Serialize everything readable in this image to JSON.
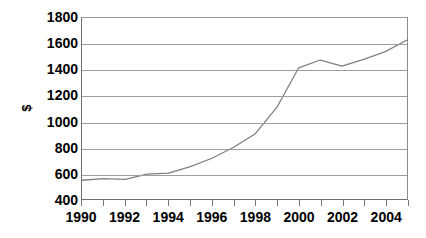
{
  "chart_data": {
    "type": "line",
    "title": "",
    "subtitle": "",
    "xlabel": "",
    "ylabel": "$",
    "xlim": [
      1990,
      2005
    ],
    "ylim": [
      400,
      1800
    ],
    "y_ticks": [
      1800,
      1600,
      1400,
      1200,
      1000,
      800,
      600,
      400
    ],
    "x_ticks": [
      1990,
      1991,
      1992,
      1993,
      1994,
      1995,
      1996,
      1997,
      1998,
      1999,
      2000,
      2001,
      2002,
      2003,
      2004,
      2005
    ],
    "x_tick_labels": [
      "1990",
      "1992",
      "1994",
      "1996",
      "1998",
      "2000",
      "2002",
      "2004"
    ],
    "x_tick_labels_years": [
      1990,
      1992,
      1994,
      1996,
      1998,
      2000,
      2002,
      2004
    ],
    "grid": true,
    "grid_axis": "y",
    "legend": false,
    "legend_position": "none",
    "series": [
      {
        "name": "$",
        "color": "#808080",
        "x": [
          1990,
          1991,
          1992,
          1993,
          1994,
          1995,
          1996,
          1997,
          1998,
          1999,
          2000,
          2001,
          2002,
          2003,
          2004,
          2005
        ],
        "values": [
          545,
          557,
          552,
          592,
          600,
          650,
          715,
          800,
          905,
          1110,
          1415,
          1475,
          1428,
          1480,
          1540,
          1630
        ]
      }
    ]
  },
  "axes": {
    "y_title": "$"
  },
  "colors": {
    "line": "#808080",
    "grid": "#9e9e9e",
    "axis": "#6f6f6f",
    "text": "#000000",
    "background": "#ffffff"
  }
}
